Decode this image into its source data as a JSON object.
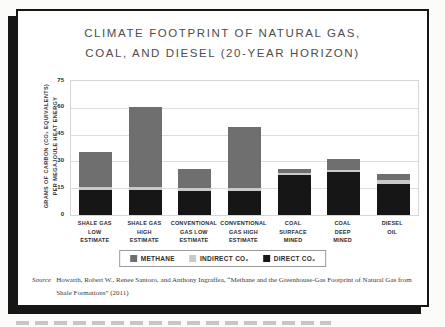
{
  "page": {
    "title_line1": "CLIMATE FOOTPRINT OF NATURAL GAS,",
    "title_line2": "COAL, AND DIESEL (20-YEAR HORIZON)",
    "source_label": "Source",
    "source_text": "Howarth, Robert W., Renee Santoro, and Anthony Ingraffea, “Methane and the Greenhouse-Gas Footprint of Natural Gas from Shale Formations” (2011)"
  },
  "legend": {
    "items": [
      {
        "label": "METHANE",
        "color": "#6f6f6f"
      },
      {
        "label": "INDIRECT CO₂",
        "color": "#c9c9c9"
      },
      {
        "label": "DIRECT CO₂",
        "color": "#161616"
      }
    ]
  },
  "chart_data": {
    "type": "bar",
    "stacked": true,
    "title": "Climate Footprint of Natural Gas, Coal, and Diesel (20-Year Horizon)",
    "ylabel_line1": "GRAMS OF CARBON (CO₂ EQUIVALENTS)",
    "ylabel_line2": "PER MEGAJOULE HEAT ENERGY",
    "ylabel": "Grams of carbon (CO2 equivalents) per megajoule heat energy",
    "ylim": [
      0,
      75
    ],
    "yticks": [
      0,
      15,
      30,
      45,
      60,
      75
    ],
    "grid": true,
    "legend_position": "bottom",
    "categories": [
      "Shale Gas Low Estimate",
      "Shale Gas High Estimate",
      "Conventional Gas Low Estimate",
      "Conventional Gas High Estimate",
      "Coal Surface Mined",
      "Coal Deep Mined",
      "Diesel Oil"
    ],
    "category_label_lines": [
      [
        "SHALE GAS",
        "LOW",
        "ESTIMATE"
      ],
      [
        "SHALE GAS",
        "HIGH",
        "ESTIMATE"
      ],
      [
        "CONVENTIONAL",
        "GAS LOW",
        "ESTIMATE"
      ],
      [
        "CONVENTIONAL",
        "GAS HIGH",
        "ESTIMATE"
      ],
      [
        "COAL",
        "SURFACE",
        "MINED"
      ],
      [
        "COAL",
        "DEEP",
        "MINED"
      ],
      [
        "DIESEL",
        "OIL"
      ]
    ],
    "series": [
      {
        "name": "Direct CO2",
        "color": "#161616",
        "values": [
          14,
          14,
          13.5,
          13.5,
          22.5,
          24,
          17.5
        ]
      },
      {
        "name": "Indirect CO2",
        "color": "#c9c9c9",
        "values": [
          1.5,
          1.5,
          1.5,
          1.5,
          1,
          1,
          2
        ]
      },
      {
        "name": "Methane",
        "color": "#6f6f6f",
        "values": [
          20,
          45,
          10.5,
          34,
          2.5,
          6.5,
          3.5
        ]
      }
    ],
    "totals": [
      35.5,
      60.5,
      25.5,
      49,
      26,
      31.5,
      23
    ]
  }
}
